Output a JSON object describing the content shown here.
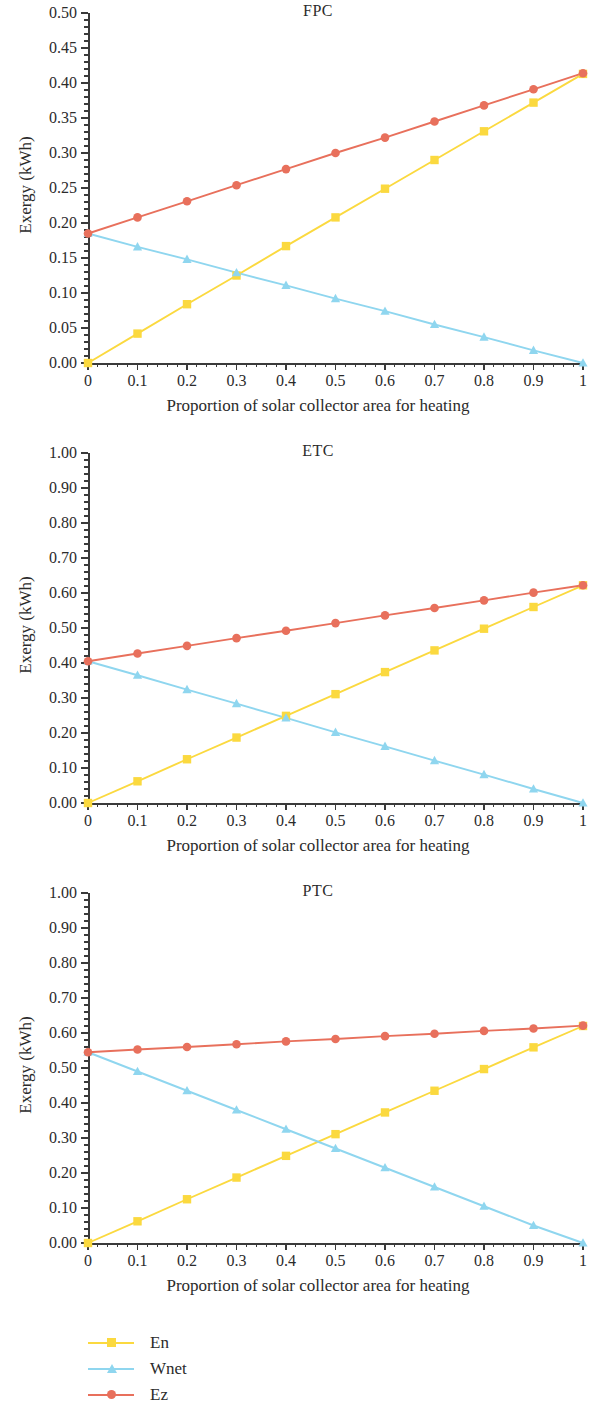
{
  "figure": {
    "panel_count": 3,
    "axis_color": "#3a3a3a",
    "background": "#ffffff"
  },
  "legend": {
    "position": "bottom-left",
    "items": [
      {
        "label": "En",
        "color": "#fbd93f",
        "marker": "square",
        "marker_icon": "square-marker-icon"
      },
      {
        "label": "Wnet",
        "color": "#8fd6ef",
        "marker": "triangle",
        "marker_icon": "triangle-marker-icon"
      },
      {
        "label": "Ez",
        "color": "#e8705c",
        "marker": "circle",
        "marker_icon": "circle-marker-icon"
      }
    ]
  },
  "chart_data": [
    {
      "type": "line",
      "title": "FPC",
      "xlabel": "Proportion of solar collector area for heating",
      "ylabel": "Exergy (kWh)",
      "grid": false,
      "legend_position": "below-figure",
      "xlim": [
        0,
        1
      ],
      "ylim": [
        0,
        0.5
      ],
      "x": [
        0,
        0.1,
        0.2,
        0.3,
        0.4,
        0.5,
        0.6,
        0.7,
        0.8,
        0.9,
        1
      ],
      "xticks": [
        "0",
        "0.1",
        "0.2",
        "0.3",
        "0.4",
        "0.5",
        "0.6",
        "0.7",
        "0.8",
        "0.9",
        "1"
      ],
      "yticks": [
        "0.00",
        "0.05",
        "0.10",
        "0.15",
        "0.20",
        "0.25",
        "0.30",
        "0.35",
        "0.40",
        "0.45",
        "0.50"
      ],
      "ytick_values": [
        0,
        0.05,
        0.1,
        0.15,
        0.2,
        0.25,
        0.3,
        0.35,
        0.4,
        0.45,
        0.5
      ],
      "y_minor_step": 0.01,
      "x_minor_step": 0.02,
      "series": [
        {
          "name": "En",
          "color": "#fbd93f",
          "marker": "square",
          "values": [
            0.0,
            0.042,
            0.084,
            0.125,
            0.167,
            0.208,
            0.249,
            0.29,
            0.331,
            0.372,
            0.413
          ]
        },
        {
          "name": "Wnet",
          "color": "#8fd6ef",
          "marker": "triangle",
          "values": [
            0.185,
            0.166,
            0.148,
            0.129,
            0.111,
            0.092,
            0.074,
            0.055,
            0.037,
            0.018,
            0.0
          ]
        },
        {
          "name": "Ez",
          "color": "#e8705c",
          "marker": "circle",
          "values": [
            0.185,
            0.208,
            0.231,
            0.254,
            0.277,
            0.3,
            0.322,
            0.345,
            0.368,
            0.391,
            0.414
          ]
        }
      ]
    },
    {
      "type": "line",
      "title": "ETC",
      "xlabel": "Proportion of solar collector area for heating",
      "ylabel": "Exergy (kWh)",
      "grid": false,
      "legend_position": "below-figure",
      "xlim": [
        0,
        1
      ],
      "ylim": [
        0,
        1.0
      ],
      "x": [
        0,
        0.1,
        0.2,
        0.3,
        0.4,
        0.5,
        0.6,
        0.7,
        0.8,
        0.9,
        1
      ],
      "xticks": [
        "0",
        "0.1",
        "0.2",
        "0.3",
        "0.4",
        "0.5",
        "0.6",
        "0.7",
        "0.8",
        "0.9",
        "1"
      ],
      "yticks": [
        "0.00",
        "0.10",
        "0.20",
        "0.30",
        "0.40",
        "0.50",
        "0.60",
        "0.70",
        "0.80",
        "0.90",
        "1.00"
      ],
      "ytick_values": [
        0,
        0.1,
        0.2,
        0.3,
        0.4,
        0.5,
        0.6,
        0.7,
        0.8,
        0.9,
        1.0
      ],
      "y_minor_step": 0.02,
      "x_minor_step": 0.02,
      "series": [
        {
          "name": "En",
          "color": "#fbd93f",
          "marker": "square",
          "values": [
            0.0,
            0.062,
            0.125,
            0.187,
            0.249,
            0.311,
            0.374,
            0.436,
            0.498,
            0.56,
            0.622
          ]
        },
        {
          "name": "Wnet",
          "color": "#8fd6ef",
          "marker": "triangle",
          "values": [
            0.405,
            0.365,
            0.324,
            0.284,
            0.243,
            0.202,
            0.162,
            0.121,
            0.081,
            0.04,
            0.0
          ]
        },
        {
          "name": "Ez",
          "color": "#e8705c",
          "marker": "circle",
          "values": [
            0.405,
            0.427,
            0.449,
            0.471,
            0.492,
            0.514,
            0.536,
            0.557,
            0.579,
            0.601,
            0.622
          ]
        }
      ]
    },
    {
      "type": "line",
      "title": "PTC",
      "xlabel": "Proportion of solar collector area for heating",
      "ylabel": "Exergy (kWh)",
      "grid": false,
      "legend_position": "below-figure",
      "xlim": [
        0,
        1
      ],
      "ylim": [
        0,
        1.0
      ],
      "x": [
        0,
        0.1,
        0.2,
        0.3,
        0.4,
        0.5,
        0.6,
        0.7,
        0.8,
        0.9,
        1
      ],
      "xticks": [
        "0",
        "0.1",
        "0.2",
        "0.3",
        "0.4",
        "0.5",
        "0.6",
        "0.7",
        "0.8",
        "0.9",
        "1"
      ],
      "yticks": [
        "0.00",
        "0.10",
        "0.20",
        "0.30",
        "0.40",
        "0.50",
        "0.60",
        "0.70",
        "0.80",
        "0.90",
        "1.00"
      ],
      "ytick_values": [
        0,
        0.1,
        0.2,
        0.3,
        0.4,
        0.5,
        0.6,
        0.7,
        0.8,
        0.9,
        1.0
      ],
      "y_minor_step": 0.02,
      "x_minor_step": 0.02,
      "series": [
        {
          "name": "En",
          "color": "#fbd93f",
          "marker": "square",
          "values": [
            0.0,
            0.062,
            0.125,
            0.187,
            0.249,
            0.311,
            0.373,
            0.435,
            0.497,
            0.559,
            0.62
          ]
        },
        {
          "name": "Wnet",
          "color": "#8fd6ef",
          "marker": "triangle",
          "values": [
            0.545,
            0.49,
            0.435,
            0.38,
            0.325,
            0.27,
            0.215,
            0.16,
            0.105,
            0.05,
            0.0
          ]
        },
        {
          "name": "Ez",
          "color": "#e8705c",
          "marker": "circle",
          "values": [
            0.545,
            0.553,
            0.56,
            0.568,
            0.576,
            0.583,
            0.591,
            0.598,
            0.606,
            0.613,
            0.621
          ]
        }
      ]
    }
  ]
}
